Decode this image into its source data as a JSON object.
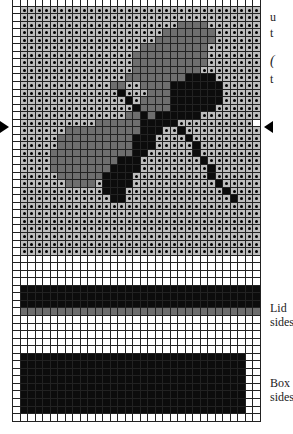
{
  "figure": {
    "labels": {
      "lid": "Lid\nsides",
      "box": "Box\nsides",
      "side_text_1": "u",
      "side_text_2": "t",
      "side_text_3": "(",
      "side_text_4": "t"
    },
    "legend": {
      "d": "light gray with dot",
      "g": "medium gray",
      "k": "black",
      ".": "white"
    },
    "rows": [
      ".................................",
      ".dddddddddddddddddddddddddddddddd.",
      ".dddddddddddddddddddddddddddddddd.",
      ".dddddddddddddddddddddggggddddddd.",
      ".dddddddddddddddddddgggggggdddddd.",
      ".ddddddddddddddddddggggggggdddddd.",
      ".ddddddddddddddddgggggggggddddddd.",
      ".dddddddddddddddggggggggggddddddd.",
      ".dddddddddddddddggggggggggddddddd.",
      ".dddddddddddddddgggggggggdddddddd.",
      ".ddddddddddddddggggggggkkkkdddddd.",
      ".ddddddddddddggddggggkkkkkkkddddd.",
      ".dddddddddddddkdddgggkkkkkkkddddd.",
      ".ddddddddddddddkdggggkkkkkkkddddd.",
      ".dddddddddddddddkggggkkkkkkdddddd.",
      ".ddddddddddddddggkgkkkkkkdddddddd.",
      ".ddddddddddggggggkkkkkdddddddddd.",
      ".ddddddggggggggggkkkddkdddddddddd.",
      ".dddddggggggggggkkkddddkddddddddd.",
      ".dddddggggggggggkkkdddddkdddddddd.",
      ".ddddgggggggggggkkddddddkdddddddd.",
      ".ddddgggggggggkkkddddddddkddddddd.",
      ".ddddggggggggkkkkdddddddddkdddddd.",
      ".dddddggggggkkkkddddddddddkdddddd.",
      ".ddddddggggdkkkkdddddddddddkddddd.",
      ".dddddddddddkkkdddddddddddddkdddd.",
      ".ddddddddddddkkddddddddddddddkddd.",
      ".dddddddddddddddddddddddddddddddd.",
      ".dddddddddddddddddddddddddddddddd.",
      ".dddddddddddddddddddddddddddddddd.",
      ".dddddddddddddddddddddddddddddddd.",
      ".dddddddddddddddddddddddddddddddd.",
      ".dddddddddddddddddddddddddddddddd.",
      ".dddddddddddddddddddddddddddddddd.",
      ".................................",
      ".................................",
      ".................................",
      ".................................",
      ".kkkkkkkkkkkkkkkkkkkkkkkkkkkkkkkk.",
      ".kkkkkkkkkkkkkkkkkkkkkkkkkkkkkkkk.",
      ".kkkkkkkkkkkkkkkkkkkkkkkkkkkkkkkk.",
      ".ggggggggggggggggggggggggggggggggg.",
      ".................................",
      ".................................",
      ".................................",
      ".................................",
      ".................................",
      ".kkkkkkkkkkkkkkkkkkkkkkkkkkkkkk...",
      ".kkkkkkkkkkkkkkkkkkkkkkkkkkkkkk...",
      ".kkkkkkkkkkkkkkkkkkkkkkkkkkkkkk...",
      ".kkkkkkkkkkkkkkkkkkkkkkkkkkkkkk...",
      ".kkkkkkkkkkkkkkkkkkkkkkkkkkkkkk...",
      ".kkkkkkkkkkkkkkkkkkkkkkkkkkkkkk...",
      ".kkkkkkkkkkkkkkkkkkkkkkkkkkkkkk...",
      ".kkkkkkkkkkkkkkkkkkkkkkkkkkkkkk...",
      "................................."
    ]
  }
}
